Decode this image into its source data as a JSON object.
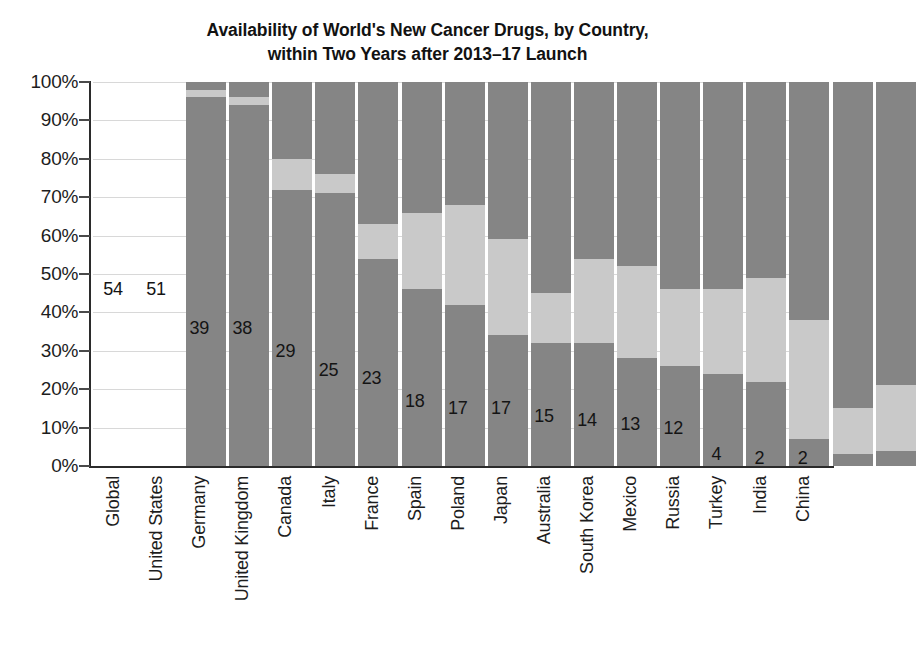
{
  "chart_data": {
    "type": "bar",
    "title": "Availability of World's New Cancer Drugs, by Country, within Two Years after 2013–17 Launch",
    "title_line1": "Availability of World's New Cancer Drugs, by Country,",
    "title_line2": "within Two Years after 2013–17 Launch",
    "subtitle": "",
    "xlabel": "",
    "ylabel": "",
    "ylim": [
      0,
      100
    ],
    "y_tick_labels": [
      "100%",
      "90%",
      "80%",
      "70%",
      "60%",
      "50%",
      "40%",
      "30%",
      "20%",
      "10%",
      "0%"
    ],
    "y_tick_values": [
      100,
      90,
      80,
      70,
      60,
      50,
      40,
      30,
      20,
      10,
      0
    ],
    "grid": true,
    "legend_position": "none",
    "stacked": true,
    "categories": [
      "Global",
      "United States",
      "Germany",
      "United Kingdom",
      "Canada",
      "Italy",
      "France",
      "Spain",
      "Poland",
      "Japan",
      "Australia",
      "South Korea",
      "Mexico",
      "Russia",
      "Turkey",
      "India",
      "China"
    ],
    "series": [
      {
        "name": "Available",
        "color": "#858585",
        "values": [
          96,
          94,
          72,
          71,
          54,
          46,
          42,
          34,
          32,
          32,
          28,
          26,
          24,
          22,
          7,
          3,
          4
        ]
      },
      {
        "name": "Partially available",
        "color": "#c9c9c9",
        "values": [
          2,
          2,
          8,
          5,
          9,
          20,
          26,
          25,
          13,
          22,
          24,
          20,
          22,
          27,
          31,
          12,
          17
        ]
      },
      {
        "name": "Not available",
        "color": "#858585",
        "values": [
          2,
          4,
          20,
          24,
          37,
          34,
          32,
          41,
          55,
          46,
          48,
          54,
          54,
          51,
          62,
          85,
          79
        ]
      }
    ],
    "bar_labels": [
      "54",
      "51",
      "39",
      "38",
      "29",
      "25",
      "23",
      "18",
      "17",
      "17",
      "15",
      "14",
      "13",
      "12",
      "4",
      "2",
      "2"
    ],
    "bar_label_note": "count of new cancer drugs available"
  },
  "bars": [
    {
      "category": "Global",
      "label": "54",
      "available": 96,
      "partial": 2,
      "unavailable": 2,
      "label_pct": 46
    },
    {
      "category": "United States",
      "label": "51",
      "available": 94,
      "partial": 2,
      "unavailable": 4,
      "label_pct": 46
    },
    {
      "category": "Germany",
      "label": "39",
      "available": 72,
      "partial": 8,
      "unavailable": 20,
      "label_pct": 36
    },
    {
      "category": "United Kingdom",
      "label": "38",
      "available": 71,
      "partial": 5,
      "unavailable": 24,
      "label_pct": 36
    },
    {
      "category": "Canada",
      "label": "29",
      "available": 54,
      "partial": 9,
      "unavailable": 37,
      "label_pct": 30
    },
    {
      "category": "Italy",
      "label": "25",
      "available": 46,
      "partial": 20,
      "unavailable": 34,
      "label_pct": 25
    },
    {
      "category": "France",
      "label": "23",
      "available": 42,
      "partial": 26,
      "unavailable": 32,
      "label_pct": 23
    },
    {
      "category": "Spain",
      "label": "18",
      "available": 34,
      "partial": 25,
      "unavailable": 41,
      "label_pct": 17
    },
    {
      "category": "Poland",
      "label": "17",
      "available": 32,
      "partial": 13,
      "unavailable": 55,
      "label_pct": 15
    },
    {
      "category": "Japan",
      "label": "17",
      "available": 32,
      "partial": 22,
      "unavailable": 46,
      "label_pct": 15
    },
    {
      "category": "Australia",
      "label": "15",
      "available": 28,
      "partial": 24,
      "unavailable": 48,
      "label_pct": 13
    },
    {
      "category": "South Korea",
      "label": "14",
      "available": 26,
      "partial": 20,
      "unavailable": 54,
      "label_pct": 12
    },
    {
      "category": "Mexico",
      "label": "13",
      "available": 24,
      "partial": 22,
      "unavailable": 54,
      "label_pct": 11
    },
    {
      "category": "Russia",
      "label": "12",
      "available": 22,
      "partial": 27,
      "unavailable": 51,
      "label_pct": 10
    },
    {
      "category": "Turkey",
      "label": "4",
      "available": 7,
      "partial": 31,
      "unavailable": 62,
      "label_pct": 3
    },
    {
      "category": "India",
      "label": "2",
      "available": 3,
      "partial": 12,
      "unavailable": 85,
      "label_pct": 2
    },
    {
      "category": "China",
      "label": "2",
      "available": 4,
      "partial": 17,
      "unavailable": 79,
      "label_pct": 2
    }
  ],
  "colors": {
    "available": "#858585",
    "partial": "#c9c9c9",
    "unavailable": "#858585",
    "gridline": "#d8d8d8",
    "axis": "#2b2b2b",
    "text": "#1d1d1d"
  }
}
